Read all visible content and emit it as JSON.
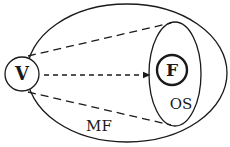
{
  "diagram": {
    "nodes": [
      {
        "id": "V",
        "label": "V",
        "shape": "circle",
        "style": "bold-label"
      },
      {
        "id": "F",
        "label": "F",
        "shape": "circle",
        "style": "thick-border bold-label"
      }
    ],
    "regions": [
      {
        "id": "MF",
        "label": "MF",
        "shape": "ellipse",
        "role": "outer region"
      },
      {
        "id": "OS",
        "label": "OS",
        "shape": "ellipse",
        "role": "inner region containing F"
      }
    ],
    "edges": [
      {
        "from": "V",
        "to": "OS-top",
        "style": "dashed"
      },
      {
        "from": "V",
        "to": "OS-bottom",
        "style": "dashed"
      },
      {
        "from": "V",
        "to": "OS",
        "style": "dashed-arrow"
      }
    ],
    "colors": {
      "stroke": "#1a1a1a",
      "background": "#ffffff"
    }
  }
}
